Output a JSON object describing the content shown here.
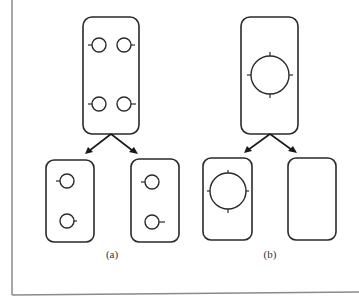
{
  "figure": {
    "panels": [
      {
        "id": "a",
        "label": "(a)",
        "parent": {
          "contents": "four small circles, each with one side tick (two rows of two)"
        },
        "children": [
          {
            "contents": "two small circles with side ticks"
          },
          {
            "contents": "two small circles with side ticks"
          }
        ]
      },
      {
        "id": "b",
        "label": "(b)",
        "parent": {
          "contents": "one large circle with four ticks (top, right, bottom, left)"
        },
        "children": [
          {
            "contents": "one large circle with four ticks"
          },
          {
            "contents": "empty"
          }
        ]
      }
    ],
    "colors": {
      "stroke": "#2a2a2a",
      "frame": "#8a8a8a",
      "background": "#ffffff"
    }
  }
}
